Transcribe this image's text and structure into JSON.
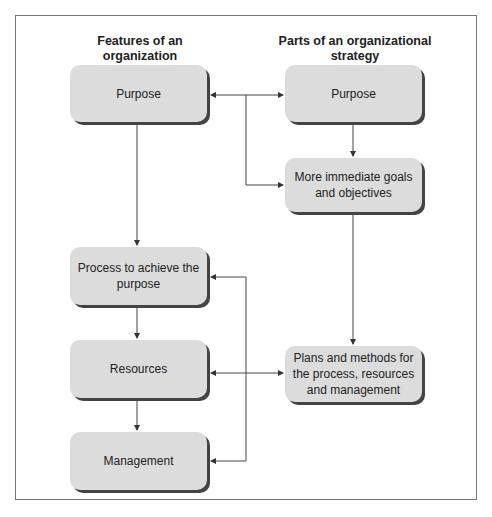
{
  "headers": {
    "left": "Features of an organization",
    "right": "Parts of an organizational strategy"
  },
  "left_column": [
    {
      "label": "Purpose"
    },
    {
      "label": "Process to achieve the purpose"
    },
    {
      "label": "Resources"
    },
    {
      "label": "Management"
    }
  ],
  "right_column": [
    {
      "label": "Purpose"
    },
    {
      "label": "More immediate goals and objectives"
    },
    {
      "label": "Plans and methods for the process, resources and management"
    }
  ]
}
